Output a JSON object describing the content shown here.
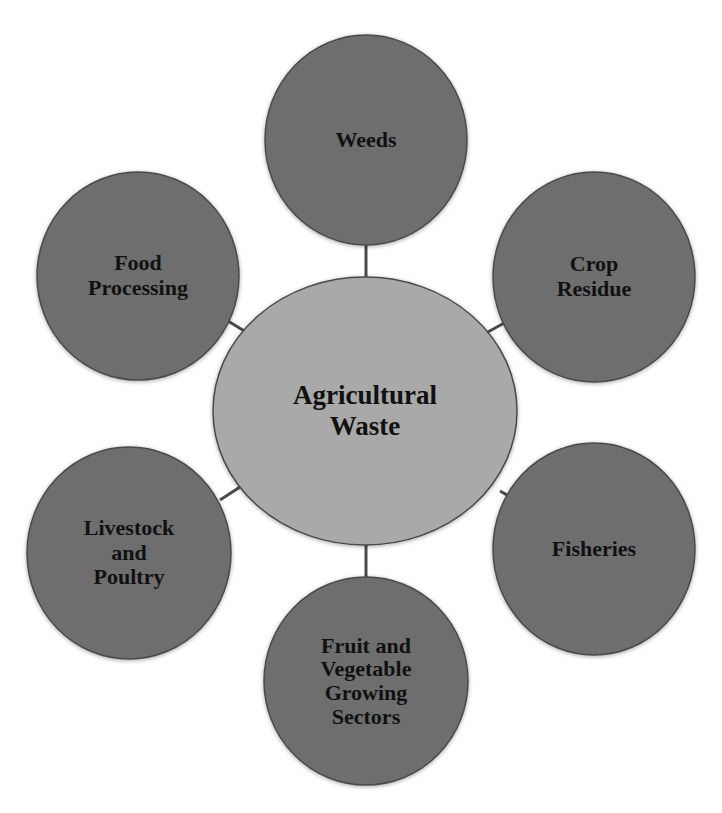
{
  "diagram": {
    "type": "hub-and-spoke",
    "colors": {
      "background": "#ffffff",
      "outer_node_fill": "#6e6e6e",
      "center_node_fill": "#a9a9a9",
      "node_stroke": "#4a4a4a",
      "connector": "#4a4a4a",
      "text": "#111111"
    },
    "center": {
      "label_lines": [
        "Agricultural",
        "Waste"
      ]
    },
    "nodes": [
      {
        "id": "weeds",
        "label_lines": [
          "Weeds"
        ]
      },
      {
        "id": "crop-residue",
        "label_lines": [
          "Crop",
          "Residue"
        ]
      },
      {
        "id": "fisheries",
        "label_lines": [
          "Fisheries"
        ]
      },
      {
        "id": "fruit-and-vegetable",
        "label_lines": [
          "Fruit and",
          "Vegetable",
          "Growing",
          "Sectors"
        ]
      },
      {
        "id": "livestock-and-poultry",
        "label_lines": [
          "Livestock",
          "and",
          "Poultry"
        ]
      },
      {
        "id": "food-processing",
        "label_lines": [
          "Food",
          "Processing"
        ]
      }
    ]
  }
}
